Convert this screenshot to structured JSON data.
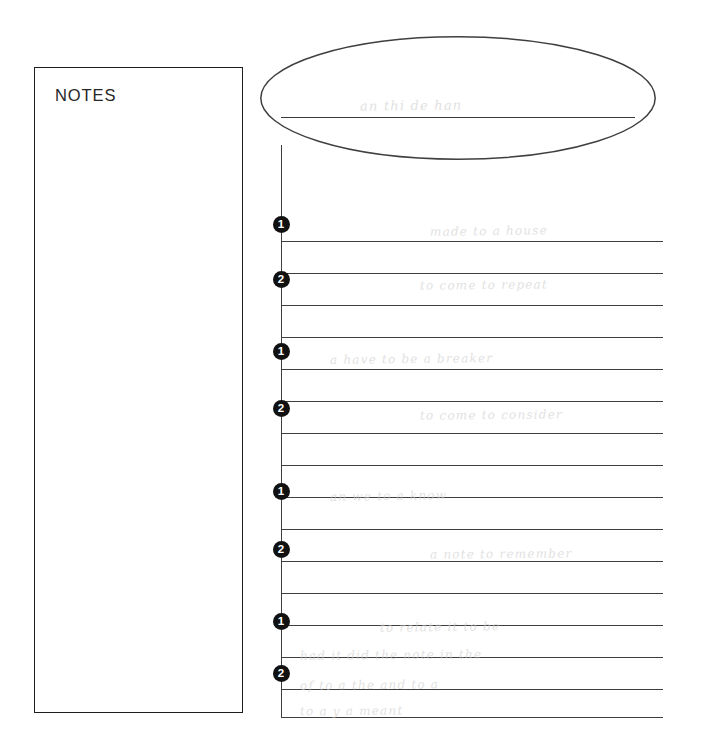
{
  "page": {
    "width": 707,
    "height": 749,
    "background": "#ffffff",
    "ink_color": "#3f3f3f",
    "bullet_color": "#111111",
    "ghost_color": "#cfcfcf"
  },
  "notes_panel": {
    "label": "NOTES",
    "x": 34,
    "y": 67,
    "width": 209,
    "height": 646
  },
  "title_bubble": {
    "shape": "ellipse",
    "x": 259,
    "y": 36,
    "width": 398,
    "height": 124,
    "writing_line": {
      "x": 281,
      "y": 117,
      "width": 354
    },
    "ghost_text": "a little note here"
  },
  "sheet": {
    "x": 281,
    "y": 145,
    "width": 382,
    "height": 572,
    "line_spacing": 32,
    "rule_y": [
      96,
      128,
      160,
      192,
      224,
      256,
      288,
      320,
      352,
      384,
      416,
      448,
      480,
      512,
      544,
      572
    ],
    "spine": {
      "x": 281,
      "y": 145,
      "height": 572
    }
  },
  "bullets": [
    {
      "number": "1",
      "glyph": "❶",
      "x": 281,
      "y": 216
    },
    {
      "number": "2",
      "glyph": "❷",
      "x": 281,
      "y": 271
    },
    {
      "number": "1",
      "glyph": "❶",
      "x": 281,
      "y": 343
    },
    {
      "number": "2",
      "glyph": "❷",
      "x": 281,
      "y": 400
    },
    {
      "number": "1",
      "glyph": "❶",
      "x": 281,
      "y": 483
    },
    {
      "number": "2",
      "glyph": "❷",
      "x": 281,
      "y": 541
    },
    {
      "number": "1",
      "glyph": "❶",
      "x": 281,
      "y": 613
    },
    {
      "number": "2",
      "glyph": "❷",
      "x": 281,
      "y": 665
    }
  ],
  "ghost_writing": [
    {
      "text": "an thi de  han",
      "x": 360,
      "y": 98,
      "size": 13,
      "rot": -0.6
    },
    {
      "text": "made to a house",
      "x": 430,
      "y": 224,
      "size": 12,
      "rot": -0.8
    },
    {
      "text": "to come to repeat",
      "x": 420,
      "y": 278,
      "size": 12,
      "rot": -0.6
    },
    {
      "text": "a have to be a breaker",
      "x": 330,
      "y": 352,
      "size": 12,
      "rot": -0.7
    },
    {
      "text": "to come to consider",
      "x": 420,
      "y": 408,
      "size": 12,
      "rot": -0.5
    },
    {
      "text": "an we to a know",
      "x": 330,
      "y": 489,
      "size": 12,
      "rot": -0.9
    },
    {
      "text": "a note to remember",
      "x": 430,
      "y": 547,
      "size": 12,
      "rot": -0.4
    },
    {
      "text": "to relate it to be",
      "x": 380,
      "y": 620,
      "size": 12,
      "rot": -0.7
    },
    {
      "text": "had  it did  the note in the",
      "x": 300,
      "y": 648,
      "size": 12,
      "rot": -0.5
    },
    {
      "text": "of  to  a  the  and  to  a",
      "x": 300,
      "y": 678,
      "size": 12,
      "rot": -0.6
    },
    {
      "text": "to  a  y  a  meant",
      "x": 300,
      "y": 704,
      "size": 12,
      "rot": -0.4
    }
  ]
}
